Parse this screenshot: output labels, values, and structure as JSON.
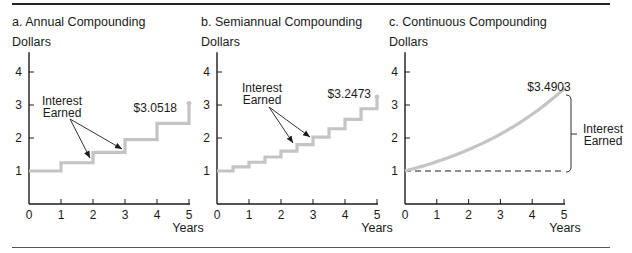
{
  "chart_data": [
    {
      "type": "line",
      "panel": "a",
      "title": "a. Annual Compounding",
      "ylabel": "Dollars",
      "xlabel": "Years",
      "x_ticks": [
        0,
        1,
        2,
        3,
        4,
        5
      ],
      "y_ticks": [
        1,
        2,
        3,
        4
      ],
      "xlim": [
        0,
        5
      ],
      "ylim": [
        0,
        4.6
      ],
      "step": true,
      "x": [
        0,
        1,
        2,
        3,
        4,
        5
      ],
      "values": [
        1.0,
        1.25,
        1.5625,
        1.9531,
        2.4414,
        3.0518
      ],
      "end_label": "$3.0518",
      "annotation": {
        "text_line1": "Interest",
        "text_line2": "Earned",
        "arrows_to": [
          [
            2,
            1.5625
          ],
          [
            3,
            1.9531
          ]
        ]
      }
    },
    {
      "type": "line",
      "panel": "b",
      "title": "b. Semiannual Compounding",
      "ylabel": "Dollars",
      "xlabel": "Years",
      "x_ticks": [
        0,
        1,
        2,
        3,
        4,
        5
      ],
      "y_ticks": [
        1,
        2,
        3,
        4
      ],
      "xlim": [
        0,
        5
      ],
      "ylim": [
        0,
        4.6
      ],
      "step": true,
      "x": [
        0,
        0.5,
        1,
        1.5,
        2,
        2.5,
        3,
        3.5,
        4,
        4.5,
        5
      ],
      "values": [
        1.0,
        1.125,
        1.2656,
        1.4238,
        1.6018,
        1.802,
        2.0273,
        2.2807,
        2.5658,
        2.8865,
        3.2473
      ],
      "end_label": "$3.2473",
      "annotation": {
        "text_line1": "Interest",
        "text_line2": "Earned",
        "arrows_to": [
          [
            2.5,
            1.802
          ],
          [
            3,
            2.0273
          ]
        ]
      }
    },
    {
      "type": "line",
      "panel": "c",
      "title": "c. Continuous Compounding",
      "ylabel": "Dollars",
      "xlabel": "Years",
      "x_ticks": [
        0,
        1,
        2,
        3,
        4,
        5
      ],
      "y_ticks": [
        1,
        2,
        3,
        4
      ],
      "xlim": [
        0,
        5
      ],
      "ylim": [
        0,
        4.6
      ],
      "step": false,
      "rate": 0.25,
      "x": [
        0,
        1,
        2,
        3,
        4,
        5
      ],
      "values": [
        1.0,
        1.284,
        1.6487,
        2.117,
        2.7183,
        3.4903
      ],
      "end_label": "$3.4903",
      "baseline": 1.0,
      "annotation": {
        "text_line1": "Interest",
        "text_line2": "Earned",
        "bracket": true
      }
    }
  ],
  "colors": {
    "series": "#c4c4c4",
    "axis": "#1a1a1a",
    "text": "#1a1a1a"
  }
}
